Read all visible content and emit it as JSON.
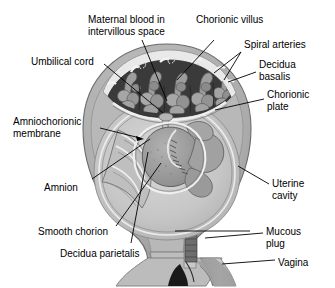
{
  "figure": {
    "type": "anatomical-diagram",
    "background_color": "#ffffff",
    "text_color": "#000000",
    "palette": {
      "myometrium_outer": "#b4b4b4",
      "myometrium_mid": "#a0a0a0",
      "decidua_light_band": "#e8e8e8",
      "intervillous_space_dark": "#3c3c3c",
      "villi_gray": "#9a9a9a",
      "amniotic_cavity": "#c8c8c8",
      "fetus_gray": "#989898",
      "highlight_white": "#f2f2f2",
      "mucous_plug_dark": "#555555",
      "vagina_shadow": "#8a8a8a",
      "leader_line": "#000000"
    }
  },
  "labels": [
    {
      "id": "maternal-blood",
      "text": "Maternal blood in\nintervillous space",
      "x": 88,
      "y": 14,
      "align": "left"
    },
    {
      "id": "chorionic-villus",
      "text": "Chorionic villus",
      "x": 196,
      "y": 14,
      "align": "left"
    },
    {
      "id": "spiral-arteries",
      "text": "Spiral arteries",
      "x": 244,
      "y": 39,
      "align": "left"
    },
    {
      "id": "decidua-basalis",
      "text": "Decidua\nbasalis",
      "x": 259,
      "y": 59,
      "align": "left"
    },
    {
      "id": "chorionic-plate",
      "text": "Chorionic\nplate",
      "x": 267,
      "y": 89,
      "align": "left"
    },
    {
      "id": "umbilical-cord",
      "text": "Umbilical cord",
      "x": 31,
      "y": 56,
      "align": "left"
    },
    {
      "id": "amniochorionic-membrane",
      "text": "Amniochorionic\nmembrane",
      "x": 13,
      "y": 116,
      "align": "left"
    },
    {
      "id": "amnion",
      "text": "Amnion",
      "x": 44,
      "y": 182,
      "align": "left"
    },
    {
      "id": "smooth-chorion",
      "text": "Smooth chorion",
      "x": 38,
      "y": 226,
      "align": "left"
    },
    {
      "id": "decidua-parietalis",
      "text": "Decidua parietalis",
      "x": 60,
      "y": 248,
      "align": "left"
    },
    {
      "id": "uterine-cavity",
      "text": "Uterine\ncavity",
      "x": 272,
      "y": 178,
      "align": "left"
    },
    {
      "id": "mucous-plug",
      "text": "Mucous\nplug",
      "x": 266,
      "y": 226,
      "align": "left"
    },
    {
      "id": "vagina",
      "text": "Vagina",
      "x": 278,
      "y": 257,
      "align": "left"
    }
  ],
  "leaders": [
    {
      "id": "leader-maternal-blood",
      "points": "142,40 167,101",
      "arrow": false
    },
    {
      "id": "leader-chorionic-villus",
      "points": "214,40 177,80",
      "arrow": false
    },
    {
      "id": "leader-spiral-arteries-a",
      "points": "241,52 214,73",
      "arrow": false
    },
    {
      "id": "leader-spiral-arteries-b",
      "points": "241,52 224,80",
      "arrow": false
    },
    {
      "id": "leader-decidua-basalis",
      "points": "256,72 228,82",
      "arrow": false
    },
    {
      "id": "leader-chorionic-plate",
      "points": "264,99 215,110",
      "arrow": false
    },
    {
      "id": "leader-umbilical-cord",
      "points": "104,64 163,113",
      "arrow": false
    },
    {
      "id": "leader-amniochorionic",
      "points": "100,128 143,139",
      "arrow": true
    },
    {
      "id": "leader-amnion",
      "points": "92,179 150,139",
      "arrow": false
    },
    {
      "id": "leader-smooth-chorion",
      "points": "116,226 161,163",
      "arrow": false
    },
    {
      "id": "leader-decidua-parietalis",
      "points": "131,243 148,152",
      "arrow": false
    },
    {
      "id": "leader-decidua-parietalis-2",
      "points": "175,231 250,231",
      "arrow": false
    },
    {
      "id": "leader-uterine-cavity",
      "points": "269,184 238,166",
      "arrow": false
    },
    {
      "id": "leader-mucous-plug",
      "points": "263,233 205,238",
      "arrow": false
    },
    {
      "id": "leader-vagina",
      "points": "275,260 222,264",
      "arrow": false
    }
  ]
}
